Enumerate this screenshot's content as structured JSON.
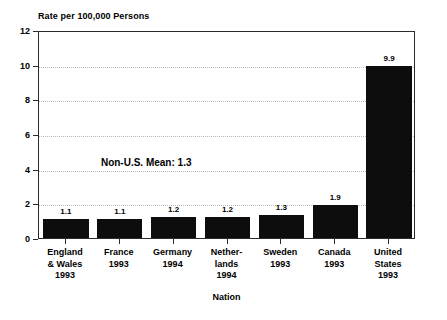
{
  "chart_data": {
    "type": "bar",
    "title": "",
    "ylabel": "Rate per 100,000 Persons",
    "xlabel": "Nation",
    "ylim": [
      0,
      12
    ],
    "yticks": [
      0,
      2,
      4,
      6,
      8,
      10,
      12
    ],
    "grid": true,
    "legend": "none",
    "categories": [
      "England & Wales 1993",
      "France 1993",
      "Germany 1994",
      "Netherlands 1994",
      "Sweden 1993",
      "Canada 1993",
      "United States 1993"
    ],
    "category_lines": [
      [
        "England",
        "& Wales",
        "1993"
      ],
      [
        "France",
        "1993"
      ],
      [
        "Germany",
        "1994"
      ],
      [
        "Nether-",
        "lands",
        "1994"
      ],
      [
        "Sweden",
        "1993"
      ],
      [
        "Canada",
        "1993"
      ],
      [
        "United",
        "States",
        "1993"
      ]
    ],
    "values": [
      1.1,
      1.1,
      1.2,
      1.2,
      1.3,
      1.9,
      9.9
    ],
    "value_labels": [
      "1.1",
      "1.1",
      "1.2",
      "1.2",
      "1.3",
      "1.9",
      "9.9"
    ],
    "bar_color": "#0d0d0d",
    "annotations": [
      {
        "text": "Non-U.S. Mean: 1.3",
        "x_value": 1.15,
        "y_value": 4.45
      }
    ]
  }
}
